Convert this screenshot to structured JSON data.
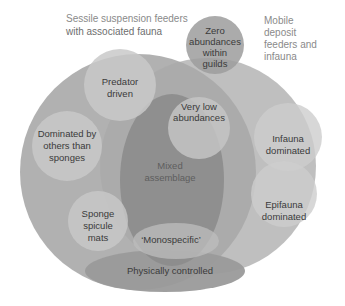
{
  "diagram": {
    "type": "venn / nested ecological categories",
    "groups": {
      "sessile": {
        "title_lines": [
          "Sessile suspension feeders",
          "with associated fauna"
        ]
      },
      "mobile": {
        "title_lines": [
          "Mobile",
          "deposit",
          "feeders and",
          "infauna"
        ]
      }
    },
    "nodes": {
      "zero": {
        "lines": [
          "Zero",
          "abundances",
          "within",
          "guilds"
        ]
      },
      "predator": {
        "lines": [
          "Predator",
          "driven"
        ]
      },
      "very_low": {
        "lines": [
          "Very low",
          "abundances"
        ]
      },
      "dominated_others": {
        "lines": [
          "Dominated by",
          "others than",
          "sponges"
        ]
      },
      "mixed": {
        "lines": [
          "Mixed",
          "assemblage"
        ]
      },
      "infauna": {
        "lines": [
          "Infauna",
          "dominated"
        ]
      },
      "epifauna": {
        "lines": [
          "Epifauna",
          "dominated"
        ]
      },
      "sponge_mats": {
        "lines": [
          "Sponge",
          "spicule",
          "mats"
        ]
      },
      "monospecific": {
        "lines": [
          "‘Monospecific’"
        ]
      },
      "physical": {
        "lines": [
          "Physically controlled"
        ]
      }
    },
    "colors": {
      "background": "#ffffff",
      "big_circles": "#a9a9a9",
      "inner_circles": "#c8c8c8",
      "mixed_ellipse": "#8f8f8f",
      "physical_ellipse": "#9e9e9e",
      "zero_circle": "#a4a4a4",
      "text_dark": "#3a3a3a",
      "text_title": "#8a8a8a"
    }
  }
}
